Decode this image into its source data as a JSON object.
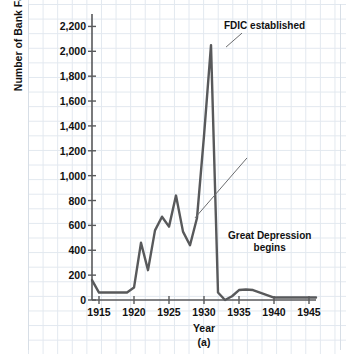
{
  "figure": {
    "source_note": "SOURCE: Federal Deposit Insurance Corporation.",
    "panel_label": "(a)"
  },
  "chart_data": {
    "type": "line",
    "title": "",
    "xlabel": "Year",
    "ylabel": "Number of Bank Failures",
    "panel": "(a)",
    "xlim": [
      1914,
      1946
    ],
    "ylim": [
      0,
      2300
    ],
    "ytick_labels": [
      "0",
      "200",
      "400",
      "600",
      "800",
      "1,000",
      "1,200",
      "1,400",
      "1,600",
      "1,800",
      "2,000",
      "2,200"
    ],
    "ytick_values": [
      0,
      200,
      400,
      600,
      800,
      1000,
      1200,
      1400,
      1600,
      1800,
      2000,
      2200
    ],
    "xtick_labels": [
      "1915",
      "1920",
      "1925",
      "1930",
      "1935",
      "1940",
      "1945"
    ],
    "xtick_values": [
      1915,
      1920,
      1925,
      1930,
      1935,
      1940,
      1945
    ],
    "grid": true,
    "legend": "none",
    "line_color": "#58595b",
    "series": [
      {
        "name": "Number of Bank Failures",
        "x": [
          1914,
          1915,
          1916,
          1917,
          1918,
          1919,
          1920,
          1921,
          1922,
          1923,
          1924,
          1925,
          1926,
          1927,
          1928,
          1929,
          1930,
          1931,
          1932,
          1933,
          1934,
          1935,
          1936,
          1937,
          1938,
          1939,
          1940,
          1941,
          1942,
          1943,
          1944,
          1945,
          1946
        ],
        "values": [
          160,
          60,
          60,
          60,
          60,
          60,
          100,
          460,
          240,
          560,
          670,
          590,
          840,
          550,
          440,
          660,
          1320,
          2050,
          60,
          0,
          30,
          80,
          85,
          80,
          60,
          40,
          20,
          20,
          20,
          20,
          20,
          20,
          20
        ]
      }
    ],
    "annotations": [
      {
        "id": "fdic",
        "text": "FDIC established",
        "points_to_year": 1933,
        "points_to_value": 2050
      },
      {
        "id": "great-depression",
        "text_line1": "Great Depression",
        "text_line2": "begins",
        "points_to_year": 1929,
        "points_to_value": 660
      }
    ]
  }
}
